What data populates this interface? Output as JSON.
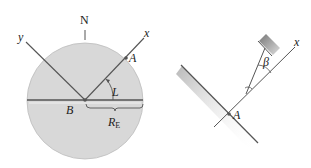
{
  "figure_left": {
    "labels": {
      "north": "N",
      "y_axis": "y",
      "x_axis": "x",
      "point_a": "A",
      "point_b": "B",
      "angle": "L",
      "radius": "R",
      "radius_sub": "E"
    },
    "colors": {
      "disk": "#d6d6d6",
      "line": "#444444"
    }
  },
  "figure_right": {
    "labels": {
      "x_axis": "x",
      "angle": "β",
      "point_a": "A"
    },
    "colors": {
      "wall_shade": "#bbbbbb",
      "line": "#444444"
    }
  }
}
